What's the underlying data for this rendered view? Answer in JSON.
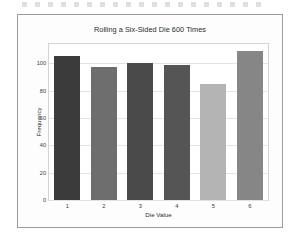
{
  "figure": {
    "background": "#fdfdfd",
    "border_color": "#9b9b9b"
  },
  "chart_data": {
    "type": "bar",
    "title": "Rolling a Six-Sided Die 600 Times",
    "xlabel": "Die Value",
    "ylabel": "Frequency",
    "categories": [
      "1",
      "2",
      "3",
      "4",
      "5",
      "6"
    ],
    "values": [
      105,
      97,
      100,
      99,
      85,
      109
    ],
    "colors": [
      "#3b3b3b",
      "#6e6e6e",
      "#4a4a4a",
      "#555555",
      "#b4b4b4",
      "#868686"
    ],
    "ylim": [
      0,
      114
    ],
    "yticks": [
      "0",
      "20",
      "40",
      "60",
      "80",
      "100"
    ],
    "ytick_values": [
      0,
      20,
      40,
      60,
      80,
      100
    ],
    "xticks": [
      "1",
      "2",
      "3",
      "4",
      "5",
      "6"
    ],
    "grid": true,
    "grid_color": "#e3e3e3",
    "legend": null,
    "legend_position": "none"
  }
}
